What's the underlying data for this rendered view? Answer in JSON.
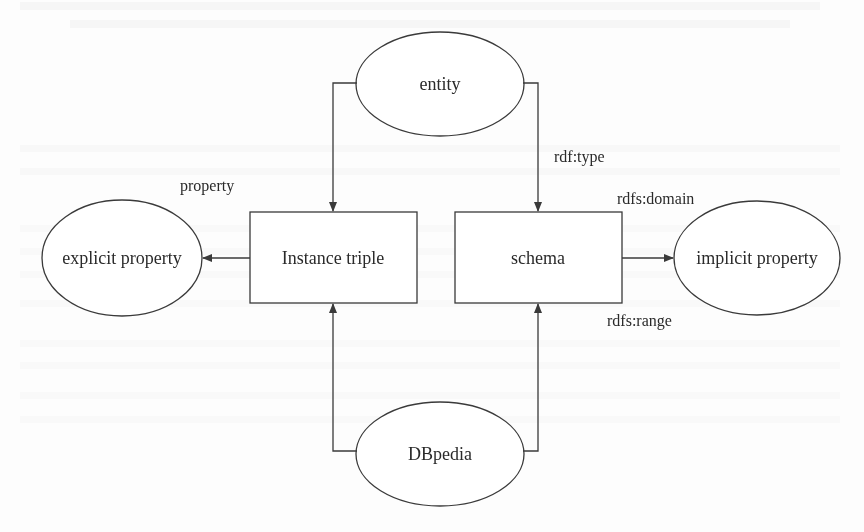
{
  "diagram": {
    "nodes": {
      "entity": {
        "label": "entity",
        "shape": "ellipse"
      },
      "instance_triple": {
        "label": "Instance triple",
        "shape": "rectangle"
      },
      "schema": {
        "label": "schema",
        "shape": "rectangle"
      },
      "explicit_property": {
        "label": "explicit property",
        "shape": "ellipse"
      },
      "implicit_property": {
        "label": "implicit property",
        "shape": "ellipse"
      },
      "dbpedia": {
        "label": "DBpedia",
        "shape": "ellipse"
      }
    },
    "edge_labels": {
      "property": "property",
      "rdf_type": "rdf:type",
      "rdfs_domain": "rdfs:domain",
      "rdfs_range": "rdfs:range"
    },
    "edges": [
      {
        "from": "entity",
        "to": "instance_triple",
        "label": ""
      },
      {
        "from": "entity",
        "to": "schema",
        "label": "rdf:type"
      },
      {
        "from": "instance_triple",
        "to": "explicit_property",
        "label": "property"
      },
      {
        "from": "schema",
        "to": "implicit_property",
        "label": "rdfs:domain / rdfs:range"
      },
      {
        "from": "dbpedia",
        "to": "instance_triple",
        "label": ""
      },
      {
        "from": "dbpedia",
        "to": "schema",
        "label": ""
      }
    ],
    "colors": {
      "stroke": "#3a3a3a",
      "text": "#2a2a2a",
      "background": "#fdfdfd"
    }
  }
}
